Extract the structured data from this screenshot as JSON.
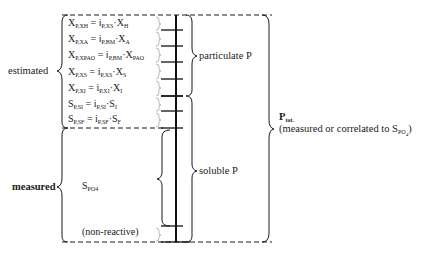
{
  "diagram": {
    "type": "phosphorus fractionation scheme",
    "left_labels": {
      "estimated": "estimated",
      "measured": "measured"
    },
    "equations": [
      {
        "lhs": "X",
        "lhs_sub": "P,XH",
        "op": " = ",
        "coef": "i",
        "coef_sub": "P,XS",
        "dot": "·",
        "var": "X",
        "var_sub": "H"
      },
      {
        "lhs": "X",
        "lhs_sub": "P,XA",
        "op": " = ",
        "coef": "i",
        "coef_sub": "P,BM",
        "dot": "·",
        "var": "X",
        "var_sub": "A"
      },
      {
        "lhs": "X",
        "lhs_sub": "P,XPAO",
        "op": " = ",
        "coef": "i",
        "coef_sub": "P,BM",
        "dot": "·",
        "var": "X",
        "var_sub": "PAO"
      },
      {
        "lhs": "X",
        "lhs_sub": "P,XS",
        "op": " = ",
        "coef": "i",
        "coef_sub": "P,XS",
        "dot": "·",
        "var": "X",
        "var_sub": "S"
      },
      {
        "lhs": "X",
        "lhs_sub": "P,XI",
        "op": " = ",
        "coef": "i",
        "coef_sub": "P,XI",
        "dot": "·",
        "var": "X",
        "var_sub": "I"
      },
      {
        "lhs": "S",
        "lhs_sub": "P,SI",
        "op": " = ",
        "coef": "i",
        "coef_sub": "P,SI",
        "dot": "·",
        "var": "S",
        "var_sub": "I"
      },
      {
        "lhs": "S",
        "lhs_sub": "P,SF",
        "op": " = ",
        "coef": "i",
        "coef_sub": "P,SF",
        "dot": "·",
        "var": "S",
        "var_sub": "F"
      }
    ],
    "measured_item": {
      "symbol": "S",
      "sub": "PO4"
    },
    "non_reactive": "(non-reactive)",
    "right_labels": {
      "particulate": "particulate P",
      "soluble": "soluble P"
    },
    "total": {
      "symbol": "P",
      "sub": "tot.",
      "note_prefix": "(measured or correlated to S",
      "note_sub_main": "PO",
      "note_sub_4": "4",
      "note_suffix": ")"
    }
  }
}
